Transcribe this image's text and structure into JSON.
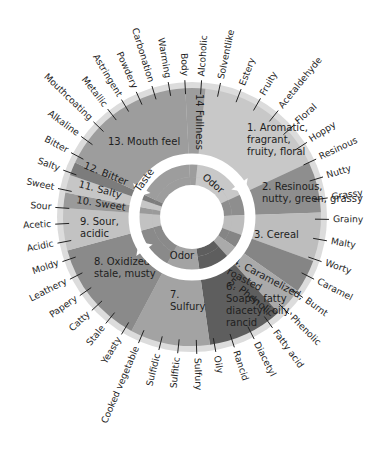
{
  "diagram": {
    "type": "flavor-wheel",
    "center": [
      192,
      217
    ],
    "radius": 135,
    "ring_labels": {
      "taste": "Taste",
      "odor_top": "Odor",
      "odor_bottom": "Odor"
    },
    "segments": [
      {
        "id": 1,
        "label_lines": [
          "1. Aromatic,",
          "fragrant,",
          "fruity, floral"
        ],
        "start": 6,
        "end": 65,
        "color": "#c8c8c8",
        "text_pos": [
          247,
          131
        ]
      },
      {
        "id": 2,
        "label_lines": [
          "2. Resinous,",
          "nutty, green, grassy"
        ],
        "start": 65,
        "end": 88,
        "color": "#8e8e8e",
        "text_pos": [
          262,
          190
        ]
      },
      {
        "id": 3,
        "label_lines": [
          "3. Cereal"
        ],
        "start": 88,
        "end": 110,
        "color": "#bdbdbd",
        "text_pos": [
          254,
          238
        ]
      },
      {
        "id": 4,
        "label_lines": [
          "4. Caramelized,",
          "roasted"
        ],
        "start": 110,
        "end": 125,
        "color": "#858585",
        "text_pos": [
          232,
          263
        ],
        "rotate": 28
      },
      {
        "id": 5,
        "label_lines": [
          "5. Phenolic"
        ],
        "start": 125,
        "end": 138,
        "color": "#aaaaaa",
        "text_pos": [
          228,
          283
        ],
        "rotate": 38
      },
      {
        "id": 6,
        "label_lines": [
          "6.",
          "Soapy, fatty",
          "diacetyl, oily,",
          "rancid"
        ],
        "start": 138,
        "end": 172,
        "color": "#5e5e5e",
        "text_pos": [
          226,
          290
        ]
      },
      {
        "id": 7,
        "label_lines": [
          "7.",
          "Sulfury"
        ],
        "start": 172,
        "end": 208,
        "color": "#a3a3a3",
        "text_pos": [
          170,
          298
        ]
      },
      {
        "id": 8,
        "label_lines": [
          "8. Oxidized,",
          "stale, musty"
        ],
        "start": 208,
        "end": 255,
        "color": "#8a8a8a",
        "text_pos": [
          94,
          265
        ]
      },
      {
        "id": 9,
        "label_lines": [
          "9. Sour,",
          "acidic"
        ],
        "start": 255,
        "end": 274,
        "color": "#c2c2c2",
        "text_pos": [
          80,
          225
        ]
      },
      {
        "id": 10,
        "label_lines": [
          "10. Sweet"
        ],
        "start": 274,
        "end": 281,
        "color": "#9a9a9a",
        "text_pos": [
          76,
          203
        ],
        "rotate": 9
      },
      {
        "id": 11,
        "label_lines": [
          "11. Salty"
        ],
        "start": 281,
        "end": 289,
        "color": "#c6c6c6",
        "text_pos": [
          78,
          187
        ],
        "rotate": 15
      },
      {
        "id": 12,
        "label_lines": [
          "12. Bitter"
        ],
        "start": 289,
        "end": 295,
        "color": "#7c7c7c",
        "text_pos": [
          83,
          168
        ],
        "rotate": 22
      },
      {
        "id": 13,
        "label_lines": [
          "13. Mouth feel"
        ],
        "start": 295,
        "end": 357,
        "color": "#9d9d9d",
        "text_pos": [
          108,
          145
        ]
      },
      {
        "id": 14,
        "label_lines": [
          "14 Fullness"
        ],
        "start": 357,
        "end": 366,
        "color": "#9d9d9d",
        "text_pos": [
          196,
          94
        ],
        "rotate": 90
      }
    ],
    "outer_terms": [
      {
        "label": "Body",
        "angle": 357
      },
      {
        "label": "Alcoholic",
        "angle": 4
      },
      {
        "label": "Solventlike",
        "angle": 12
      },
      {
        "label": "Estery",
        "angle": 21
      },
      {
        "label": "Fruity",
        "angle": 30
      },
      {
        "label": "Acetaldehyde",
        "angle": 39
      },
      {
        "label": "Floral",
        "angle": 48
      },
      {
        "label": "Hoppy",
        "angle": 57
      },
      {
        "label": "Resinous",
        "angle": 65
      },
      {
        "label": "Nutty",
        "angle": 73
      },
      {
        "label": "Grassy",
        "angle": 82
      },
      {
        "label": "Grainy",
        "angle": 91
      },
      {
        "label": "Malty",
        "angle": 100
      },
      {
        "label": "Worty",
        "angle": 109
      },
      {
        "label": "Caramel",
        "angle": 117
      },
      {
        "label": "Burnt",
        "angle": 126
      },
      {
        "label": "Phenolic",
        "angle": 135
      },
      {
        "label": "Fatty acid",
        "angle": 144
      },
      {
        "label": "Diacetyl",
        "angle": 153
      },
      {
        "label": "Rancid",
        "angle": 162
      },
      {
        "label": "Oily",
        "angle": 170
      },
      {
        "label": "Sulfury",
        "angle": 178
      },
      {
        "label": "Sulfitic",
        "angle": 186
      },
      {
        "label": "Sulfidic",
        "angle": 194
      },
      {
        "label": "Cooked vegetable",
        "angle": 203
      },
      {
        "label": "Yeasty",
        "angle": 211
      },
      {
        "label": "Stale",
        "angle": 219
      },
      {
        "label": "Catty",
        "angle": 227
      },
      {
        "label": "Papery",
        "angle": 235
      },
      {
        "label": "Leathery",
        "angle": 243
      },
      {
        "label": "Moldy",
        "angle": 251
      },
      {
        "label": "Acidic",
        "angle": 259
      },
      {
        "label": "Acetic",
        "angle": 267
      },
      {
        "label": "Sour",
        "angle": 274
      },
      {
        "label": "Sweet",
        "angle": 282
      },
      {
        "label": "Salty",
        "angle": 290
      },
      {
        "label": "Bitter",
        "angle": 298
      },
      {
        "label": "Alkaline",
        "angle": 306
      },
      {
        "label": "Mouthcoating",
        "angle": 314
      },
      {
        "label": "Metallic",
        "angle": 322
      },
      {
        "label": "Astringent",
        "angle": 329
      },
      {
        "label": "Powdery",
        "angle": 336
      },
      {
        "label": "Carbonation",
        "angle": 343
      },
      {
        "label": "Warming",
        "angle": 350
      }
    ],
    "colors": {
      "rim": "#dcdcdc",
      "arrow": "#ffffff",
      "inner_ring": "#bcbcbc",
      "hub": "#ffffff"
    }
  }
}
